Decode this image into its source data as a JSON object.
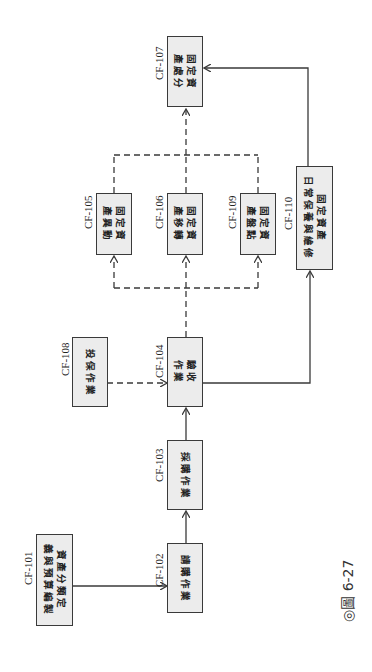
{
  "diagram": {
    "orientation": "rotated 90deg clockwise",
    "caption": "◎圖 6-27",
    "colors": {
      "box_fill": "#ececec",
      "box_border": "#3a3a3a",
      "line": "#3a3a3a"
    },
    "nodes": [
      {
        "id": "CF-101",
        "label": "資產分類定\n義與預算編製"
      },
      {
        "id": "CF-102",
        "label": "請購作業"
      },
      {
        "id": "CF-103",
        "label": "採購作業"
      },
      {
        "id": "CF-104",
        "label": "驗收\n作業"
      },
      {
        "id": "CF-105",
        "label": "固定資\n產異動"
      },
      {
        "id": "CF-106",
        "label": "固定資\n產移轉"
      },
      {
        "id": "CF-107",
        "label": "固定資\n產處分"
      },
      {
        "id": "CF-108",
        "label": "投保作業"
      },
      {
        "id": "CF-109",
        "label": "固定資\n產盤點"
      },
      {
        "id": "CF-110",
        "label": "固定資產\n日常保養與維修"
      }
    ],
    "edges": [
      {
        "from": "CF-101",
        "to": "CF-102",
        "style": "solid"
      },
      {
        "from": "CF-102",
        "to": "CF-103",
        "style": "solid"
      },
      {
        "from": "CF-103",
        "to": "CF-104",
        "style": "solid"
      },
      {
        "from": "CF-108",
        "to": "CF-104",
        "style": "dashed"
      },
      {
        "from": "CF-104",
        "to": "CF-105",
        "style": "dashed"
      },
      {
        "from": "CF-104",
        "to": "CF-106",
        "style": "dashed"
      },
      {
        "from": "CF-104",
        "to": "CF-109",
        "style": "dashed"
      },
      {
        "from": "CF-105",
        "to": "CF-107",
        "style": "dashed"
      },
      {
        "from": "CF-106",
        "to": "CF-107",
        "style": "dashed"
      },
      {
        "from": "CF-109",
        "to": "CF-107",
        "style": "dashed"
      },
      {
        "from": "CF-104",
        "to": "CF-110",
        "style": "solid"
      },
      {
        "from": "CF-110",
        "to": "CF-107",
        "style": "solid"
      }
    ]
  }
}
